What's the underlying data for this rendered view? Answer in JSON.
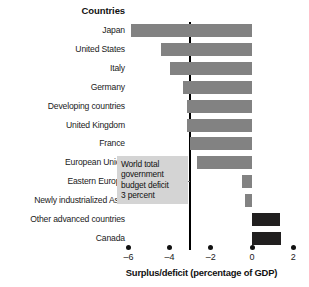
{
  "header": {
    "title": "Countries"
  },
  "axis": {
    "title": "Surplus/deficit (percentage of GDP)",
    "ticks": [
      "–6",
      "–4",
      "–2",
      "0",
      "2"
    ]
  },
  "annotation": {
    "text": "World total\ngovernment\nbudget deficit\n3 percent",
    "value": -3
  },
  "colors": {
    "bar_negative": "#828282",
    "bar_positive": "#211f1f",
    "reference_line": "#000000",
    "callout_background": "#d4d4d4",
    "text": "#1a1a1a",
    "background": "#ffffff"
  },
  "chart_data": {
    "type": "bar",
    "orientation": "horizontal",
    "title": "",
    "xlabel": "Surplus/deficit (percentage of GDP)",
    "ylabel": "Countries",
    "xlim": [
      -6.6,
      2.4
    ],
    "xticks": [
      -6,
      -4,
      -2,
      0,
      2
    ],
    "grid": false,
    "legend": false,
    "categories": [
      "Japan",
      "United States",
      "Italy",
      "Germany",
      "Developing countries",
      "United Kingdom",
      "France",
      "European Union",
      "Eastern Europe",
      "Newly industrialized Asia",
      "Other advanced countries",
      "Canada"
    ],
    "values": [
      -5.9,
      -4.4,
      -4.0,
      -3.35,
      -3.15,
      -3.15,
      -3.0,
      -2.65,
      -0.5,
      -0.35,
      1.35,
      1.4
    ],
    "annotations": [
      {
        "type": "vline",
        "x": -3,
        "label": "World total government budget deficit 3 percent"
      }
    ]
  }
}
